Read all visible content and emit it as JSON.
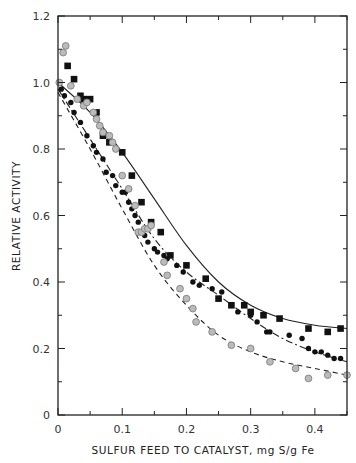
{
  "chart_data": {
    "type": "scatter",
    "title": "",
    "xlabel": "SULFUR FEED TO CATALYST, mg S/g Fe",
    "ylabel": "RELATIVE ACTIVITY",
    "xlim": [
      0,
      0.45
    ],
    "ylim": [
      0,
      1.2
    ],
    "xticks": [
      0,
      0.1,
      0.2,
      0.3,
      0.4
    ],
    "xtick_labels": [
      "0",
      "0.1",
      "0.2",
      "0.3",
      "0.4"
    ],
    "yticks": [
      0,
      0.2,
      0.4,
      0.6,
      0.8,
      1.0,
      1.2
    ],
    "ytick_labels": [
      "0",
      "0.2",
      "0.4",
      "0.6",
      "0.8",
      "1.0",
      "1.2"
    ],
    "grid": false,
    "legend": null,
    "series": [
      {
        "name": "filled squares",
        "marker": "square",
        "fill": "#111111",
        "curve_style": "solid",
        "x": [
          0.015,
          0.025,
          0.035,
          0.04,
          0.05,
          0.06,
          0.07,
          0.08,
          0.1,
          0.115,
          0.13,
          0.145,
          0.16,
          0.175,
          0.2,
          0.23,
          0.25,
          0.27,
          0.29,
          0.3,
          0.32,
          0.345,
          0.39,
          0.42,
          0.44
        ],
        "y": [
          1.05,
          1.01,
          0.96,
          0.95,
          0.95,
          0.91,
          0.84,
          0.82,
          0.79,
          0.72,
          0.64,
          0.58,
          0.55,
          0.48,
          0.45,
          0.41,
          0.35,
          0.33,
          0.33,
          0.31,
          0.3,
          0.29,
          0.26,
          0.25,
          0.26
        ],
        "fit_x": [
          0.0,
          0.05,
          0.1,
          0.15,
          0.2,
          0.25,
          0.3,
          0.35,
          0.4,
          0.45
        ],
        "fit_y": [
          1.0,
          0.91,
          0.79,
          0.65,
          0.51,
          0.4,
          0.33,
          0.29,
          0.27,
          0.26
        ]
      },
      {
        "name": "filled circles",
        "marker": "circle",
        "fill": "#111111",
        "curve_style": "dash-dot",
        "x": [
          0.005,
          0.01,
          0.02,
          0.025,
          0.035,
          0.045,
          0.055,
          0.06,
          0.07,
          0.075,
          0.085,
          0.09,
          0.1,
          0.105,
          0.11,
          0.115,
          0.12,
          0.125,
          0.135,
          0.14,
          0.15,
          0.155,
          0.165,
          0.17,
          0.185,
          0.195,
          0.21,
          0.22,
          0.24,
          0.255,
          0.27,
          0.28,
          0.3,
          0.31,
          0.325,
          0.33,
          0.36,
          0.38,
          0.39,
          0.4,
          0.41,
          0.42,
          0.43,
          0.44
        ],
        "y": [
          0.98,
          0.96,
          0.94,
          0.91,
          0.88,
          0.84,
          0.81,
          0.79,
          0.77,
          0.73,
          0.72,
          0.69,
          0.67,
          0.67,
          0.64,
          0.62,
          0.6,
          0.58,
          0.54,
          0.52,
          0.5,
          0.49,
          0.48,
          0.47,
          0.45,
          0.43,
          0.4,
          0.39,
          0.38,
          0.37,
          0.33,
          0.31,
          0.3,
          0.28,
          0.25,
          0.25,
          0.24,
          0.23,
          0.2,
          0.19,
          0.19,
          0.18,
          0.17,
          0.17
        ],
        "fit_x": [
          0.0,
          0.05,
          0.1,
          0.15,
          0.2,
          0.25,
          0.3,
          0.35,
          0.4,
          0.45
        ],
        "fit_y": [
          0.98,
          0.83,
          0.68,
          0.53,
          0.43,
          0.36,
          0.29,
          0.23,
          0.19,
          0.16
        ]
      },
      {
        "name": "open gray circles",
        "marker": "circle-open",
        "fill": "#bbbbbb",
        "curve_style": "dashed",
        "x": [
          0.002,
          0.008,
          0.012,
          0.02,
          0.03,
          0.04,
          0.045,
          0.055,
          0.06,
          0.065,
          0.07,
          0.08,
          0.085,
          0.09,
          0.1,
          0.11,
          0.12,
          0.125,
          0.13,
          0.135,
          0.14,
          0.145,
          0.165,
          0.17,
          0.19,
          0.2,
          0.21,
          0.215,
          0.24,
          0.27,
          0.3,
          0.33,
          0.37,
          0.39,
          0.42,
          0.45
        ],
        "y": [
          1.0,
          1.09,
          1.11,
          0.99,
          0.95,
          0.93,
          0.94,
          0.91,
          0.89,
          0.87,
          0.85,
          0.84,
          0.82,
          0.8,
          0.72,
          0.68,
          0.63,
          0.55,
          0.55,
          0.56,
          0.56,
          0.57,
          0.46,
          0.42,
          0.38,
          0.35,
          0.32,
          0.28,
          0.25,
          0.21,
          0.2,
          0.16,
          0.14,
          0.11,
          0.12,
          0.12
        ],
        "fit_x": [
          0.0,
          0.05,
          0.1,
          0.15,
          0.2,
          0.25,
          0.3,
          0.35,
          0.4,
          0.45
        ],
        "fit_y": [
          0.97,
          0.8,
          0.62,
          0.45,
          0.33,
          0.24,
          0.19,
          0.16,
          0.14,
          0.12
        ]
      }
    ]
  },
  "plot": {
    "left": 58,
    "right": 347,
    "top": 16,
    "bottom": 415
  }
}
